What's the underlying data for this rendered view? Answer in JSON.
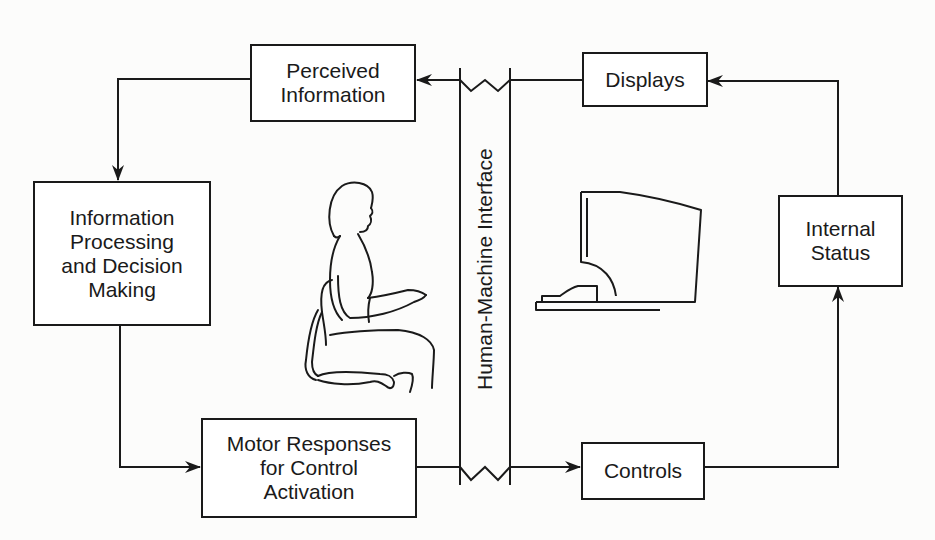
{
  "diagram": {
    "boxes": {
      "perceived_information": "Perceived\nInformation",
      "displays": "Displays",
      "information_processing": "Information\nProcessing\nand Decision\nMaking",
      "internal_status": "Internal\nStatus",
      "motor_responses": "Motor Responses\nfor Control\nActivation",
      "controls": "Controls"
    },
    "interface_label": "Human-Machine Interface",
    "illustrations": [
      {
        "name": "seated-operator",
        "description": "Woman seated on an office chair with hands raised toward a keyboard"
      },
      {
        "name": "computer-workstation",
        "description": "Computer monitor side view with keyboard on desk"
      }
    ],
    "flows": [
      {
        "from": "Displays",
        "to": "Perceived Information",
        "crosses": "Human-Machine Interface"
      },
      {
        "from": "Perceived Information",
        "to": "Information Processing and Decision Making"
      },
      {
        "from": "Information Processing and Decision Making",
        "to": "Motor Responses for Control Activation"
      },
      {
        "from": "Motor Responses for Control Activation",
        "to": "Controls",
        "crosses": "Human-Machine Interface"
      },
      {
        "from": "Controls",
        "to": "Internal Status"
      },
      {
        "from": "Internal Status",
        "to": "Displays"
      }
    ],
    "colors": {
      "stroke": "#1a1a1a",
      "background": "#ffffff"
    }
  }
}
